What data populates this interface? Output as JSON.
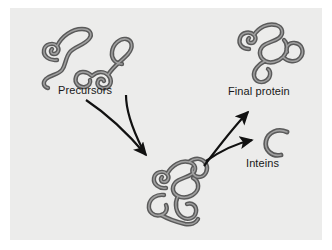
{
  "figure": {
    "background_color": "#ffffff",
    "panel_color": "#ececeb",
    "chain_stroke_color": "#5a5a5a",
    "chain_highlight_color": "#9a9a9a",
    "arrow_color": "#111111",
    "label_color": "#181818"
  },
  "labels": {
    "precursors": "Precursors",
    "final_protein": "Final protein",
    "inteins": "Inteins"
  },
  "molecules": [
    {
      "id": "precursor-left",
      "label_ref": "precursors",
      "description": "coiled polypeptide chain with spiral and upper loop",
      "position": {
        "x": 35,
        "y": 22,
        "width": 55,
        "height": 65
      }
    },
    {
      "id": "precursor-right",
      "label_ref": "precursors",
      "description": "coiled polypeptide chain with upper loop, spiral and lower C hook",
      "position": {
        "x": 85,
        "y": 25,
        "width": 60,
        "height": 65
      }
    },
    {
      "id": "intermediate-complex",
      "label_ref": null,
      "description": "large folded precursor complex formed from both precursors",
      "position": {
        "x": 140,
        "y": 155,
        "width": 95,
        "height": 80
      }
    },
    {
      "id": "final-protein",
      "label_ref": "final_protein",
      "description": "mature folded protein chain",
      "position": {
        "x": 228,
        "y": 20,
        "width": 95,
        "height": 70
      }
    },
    {
      "id": "inteins",
      "label_ref": "inteins",
      "description": "short excised C-shaped intein segment",
      "position": {
        "x": 262,
        "y": 128,
        "width": 28,
        "height": 28
      }
    }
  ],
  "arrows": [
    {
      "id": "arrow-precursor-left-to-intermediate",
      "from": "precursor-left",
      "to": "intermediate-complex",
      "direction": "down-right"
    },
    {
      "id": "arrow-precursor-right-to-intermediate",
      "from": "precursor-right",
      "to": "intermediate-complex",
      "direction": "down"
    },
    {
      "id": "arrow-intermediate-to-final-protein",
      "from": "intermediate-complex",
      "to": "final-protein",
      "direction": "up-right"
    },
    {
      "id": "arrow-intermediate-to-inteins",
      "from": "intermediate-complex",
      "to": "inteins",
      "direction": "right"
    }
  ]
}
